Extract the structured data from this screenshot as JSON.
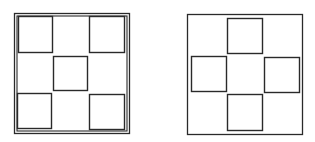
{
  "diagram": {
    "stroke_color": "#2a2a2a",
    "background": "#ffffff",
    "figures": [
      {
        "id": "left",
        "description": "Square frame (double border) with five small squares in an X / quincunx arrangement",
        "frame": {
          "x": 14,
          "y": 13,
          "w": 115,
          "h": 120,
          "double": true,
          "inner_offset": 2.5
        },
        "squares": [
          {
            "pos": "top-left",
            "x": 18,
            "y": 16,
            "w": 34,
            "h": 36
          },
          {
            "pos": "top-right",
            "x": 89,
            "y": 16,
            "w": 35,
            "h": 36
          },
          {
            "pos": "center",
            "x": 53,
            "y": 56,
            "w": 34,
            "h": 34
          },
          {
            "pos": "bottom-left",
            "x": 17,
            "y": 93,
            "w": 34,
            "h": 35
          },
          {
            "pos": "bottom-right",
            "x": 89,
            "y": 94,
            "w": 35,
            "h": 35
          }
        ]
      },
      {
        "id": "right",
        "description": "Square frame (single border) with four small squares in a plus / cross arrangement",
        "frame": {
          "x": 187,
          "y": 14,
          "w": 115,
          "h": 120,
          "double": false
        },
        "squares": [
          {
            "pos": "top",
            "x": 227,
            "y": 18,
            "w": 35,
            "h": 35
          },
          {
            "pos": "left",
            "x": 191,
            "y": 56,
            "w": 35,
            "h": 35
          },
          {
            "pos": "right",
            "x": 264,
            "y": 57,
            "w": 35,
            "h": 35
          },
          {
            "pos": "bottom",
            "x": 227,
            "y": 94,
            "w": 35,
            "h": 36
          }
        ]
      }
    ]
  }
}
